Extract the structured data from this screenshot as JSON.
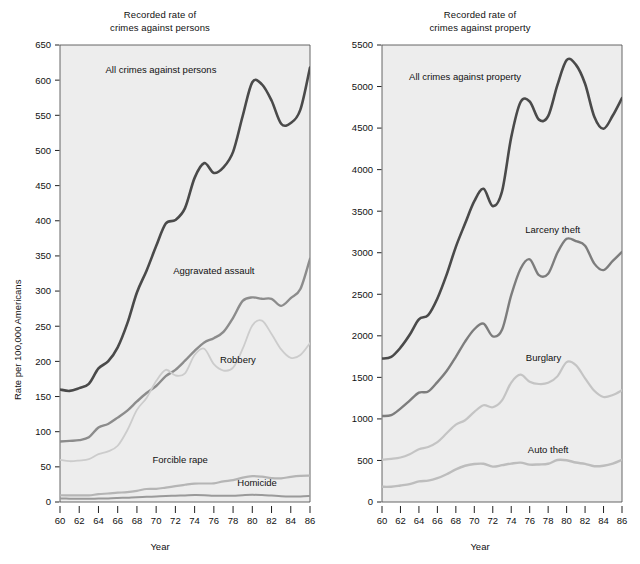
{
  "figure": {
    "width": 640,
    "height": 564,
    "background": "#ffffff",
    "plot_background": "#ededed",
    "axis_color": "#555555"
  },
  "panels": [
    {
      "key": "persons",
      "title_line1": "Recorded rate of",
      "title_line2": "crimes against persons",
      "ylabel": "Rate per 100,000 Americans",
      "xlabel": "Year"
    },
    {
      "key": "property",
      "title_line1": "Recorded rate of",
      "title_line2": "crimes against property",
      "ylabel": "Rate per 100,000 Americans",
      "xlabel": "Year"
    }
  ],
  "chart_data": [
    {
      "type": "line",
      "title": "Recorded rate of crimes against persons",
      "xlabel": "Year",
      "ylabel": "Rate per 100,000 Americans",
      "xlim": [
        60,
        86
      ],
      "ylim": [
        0,
        650
      ],
      "xticks": [
        60,
        62,
        64,
        66,
        68,
        70,
        72,
        74,
        76,
        78,
        80,
        82,
        84,
        86
      ],
      "xtick_labels": [
        "60",
        "62",
        "64",
        "66",
        "68",
        "70",
        "72",
        "74",
        "76",
        "78",
        "80",
        "82",
        "84",
        "86"
      ],
      "yticks": [
        0,
        50,
        100,
        150,
        200,
        250,
        300,
        350,
        400,
        450,
        500,
        550,
        600,
        650
      ],
      "ytick_labels": [
        "0",
        "50",
        "100",
        "150",
        "200",
        "250",
        "300",
        "350",
        "400",
        "450",
        "500",
        "550",
        "600",
        "650"
      ],
      "grid": false,
      "legend": "inline-annotations",
      "x": [
        60,
        61,
        62,
        63,
        64,
        65,
        66,
        67,
        68,
        69,
        70,
        71,
        72,
        73,
        74,
        75,
        76,
        77,
        78,
        79,
        80,
        81,
        82,
        83,
        84,
        85,
        86
      ],
      "series": [
        {
          "name": "All crimes against persons",
          "color": "#4a4a4a",
          "width": 2.6,
          "label_x": 70.5,
          "label_y": 610,
          "values": [
            160,
            158,
            162,
            168,
            190,
            200,
            220,
            254,
            298,
            329,
            364,
            396,
            401,
            418,
            461,
            482,
            468,
            476,
            498,
            549,
            597,
            594,
            571,
            538,
            539,
            558,
            618
          ]
        },
        {
          "name": "Aggravated assault",
          "color": "#8c8c8c",
          "width": 2.4,
          "label_x": 76.0,
          "label_y": 325,
          "values": [
            86,
            87,
            88,
            92,
            106,
            111,
            120,
            130,
            143,
            155,
            165,
            179,
            188,
            201,
            215,
            227,
            233,
            242,
            262,
            286,
            291,
            289,
            289,
            279,
            290,
            303,
            346
          ]
        },
        {
          "name": "Robbery",
          "color": "#cccccc",
          "width": 1.8,
          "label_x": 78.5,
          "label_y": 198,
          "values": [
            60,
            58,
            59,
            61,
            68,
            72,
            80,
            102,
            131,
            148,
            172,
            188,
            180,
            183,
            209,
            218,
            196,
            187,
            191,
            218,
            251,
            258,
            239,
            217,
            205,
            209,
            226
          ]
        },
        {
          "name": "Forcible rape",
          "color": "#b5b5b5",
          "width": 2.2,
          "label_x": 72.5,
          "label_y": 55,
          "values": [
            9.6,
            9.4,
            9.4,
            9.4,
            11.2,
            12.1,
            13.2,
            14.0,
            15.9,
            18.5,
            18.7,
            20.5,
            22.5,
            24.5,
            26.2,
            26.3,
            26.6,
            29.4,
            31.0,
            34.7,
            36.8,
            36.0,
            34.0,
            33.7,
            35.7,
            37.1,
            37.5
          ]
        },
        {
          "name": "Homicide",
          "color": "#9a9a9a",
          "width": 2.0,
          "label_x": 80.5,
          "label_y": 23,
          "values": [
            5.1,
            4.8,
            4.6,
            4.6,
            4.9,
            5.1,
            5.6,
            6.2,
            6.9,
            7.3,
            7.9,
            8.6,
            9.0,
            9.4,
            9.8,
            9.6,
            8.8,
            8.8,
            9.0,
            9.7,
            10.2,
            9.8,
            9.1,
            8.3,
            7.9,
            7.9,
            8.6
          ]
        }
      ]
    },
    {
      "type": "line",
      "title": "Recorded rate of crimes against property",
      "xlabel": "Year",
      "ylabel": "Rate per 100,000 Americans",
      "xlim": [
        60,
        86
      ],
      "ylim": [
        0,
        5500
      ],
      "xticks": [
        60,
        62,
        64,
        66,
        68,
        70,
        72,
        74,
        76,
        78,
        80,
        82,
        84,
        86
      ],
      "xtick_labels": [
        "60",
        "62",
        "64",
        "66",
        "68",
        "70",
        "72",
        "74",
        "76",
        "78",
        "80",
        "82",
        "84",
        "86"
      ],
      "yticks": [
        0,
        500,
        1000,
        1500,
        2000,
        2500,
        3000,
        3500,
        4000,
        4500,
        5000,
        5500
      ],
      "ytick_labels": [
        "0",
        "500",
        "1000",
        "1500",
        "2000",
        "2500",
        "3000",
        "3500",
        "4000",
        "4500",
        "5000",
        "5500"
      ],
      "grid": false,
      "legend": "inline-annotations",
      "x": [
        60,
        61,
        62,
        63,
        64,
        65,
        66,
        67,
        68,
        69,
        70,
        71,
        72,
        73,
        74,
        75,
        76,
        77,
        78,
        79,
        80,
        81,
        82,
        83,
        84,
        85,
        86
      ],
      "series": [
        {
          "name": "All crimes against property",
          "color": "#4a4a4a",
          "width": 2.6,
          "label_x": 69.0,
          "label_y": 5080,
          "values": [
            1726,
            1747,
            1857,
            2012,
            2198,
            2249,
            2450,
            2736,
            3071,
            3351,
            3621,
            3769,
            3561,
            3737,
            4389,
            4811,
            4820,
            4602,
            4643,
            5017,
            5319,
            5264,
            5033,
            4637,
            4492,
            4651,
            4862
          ]
        },
        {
          "name": "Larceny theft",
          "color": "#7d7d7d",
          "width": 2.4,
          "label_x": 78.5,
          "label_y": 3240,
          "values": [
            1035,
            1045,
            1124,
            1219,
            1316,
            1329,
            1443,
            1576,
            1747,
            1931,
            2079,
            2146,
            1994,
            2072,
            2490,
            2805,
            2921,
            2730,
            2747,
            2999,
            3167,
            3140,
            3085,
            2869,
            2791,
            2901,
            3010
          ]
        },
        {
          "name": "Burglary",
          "color": "#c4c4c4",
          "width": 2.2,
          "label_x": 77.5,
          "label_y": 1700,
          "values": [
            509,
            519,
            536,
            576,
            635,
            663,
            721,
            827,
            932,
            984,
            1085,
            1164,
            1141,
            1223,
            1438,
            1532,
            1448,
            1420,
            1434,
            1512,
            1684,
            1647,
            1488,
            1338,
            1264,
            1287,
            1345
          ]
        },
        {
          "name": "Auto theft",
          "color": "#bdbdbd",
          "width": 2.4,
          "label_x": 78.0,
          "label_y": 590,
          "values": [
            183,
            184,
            199,
            216,
            248,
            257,
            286,
            334,
            393,
            436,
            457,
            460,
            426,
            443,
            462,
            474,
            450,
            452,
            460,
            505,
            502,
            475,
            459,
            431,
            437,
            463,
            508
          ]
        }
      ]
    }
  ]
}
